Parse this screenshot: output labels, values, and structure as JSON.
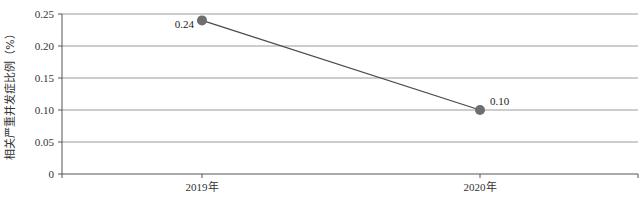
{
  "chart_data": {
    "type": "line",
    "title": "",
    "xlabel": "",
    "ylabel": "相关严重并发症比例（%）",
    "categories": [
      "2019年",
      "2020年"
    ],
    "series": [
      {
        "name": "相关严重并发症比例",
        "values": [
          0.24,
          0.1
        ],
        "labels": [
          "0.24",
          "0.10"
        ],
        "color": "#4a4a4a",
        "marker_color": "#6e6e6e"
      }
    ],
    "ylim": [
      0,
      0.25
    ],
    "yticks": [
      0,
      0.05,
      0.1,
      0.15,
      0.2,
      0.25
    ],
    "ytick_labels": [
      "0",
      "0.05",
      "0.10",
      "0.15",
      "0.20",
      "0.25"
    ],
    "grid": true,
    "grid_color": "#9a9a9a",
    "legend": "none"
  }
}
